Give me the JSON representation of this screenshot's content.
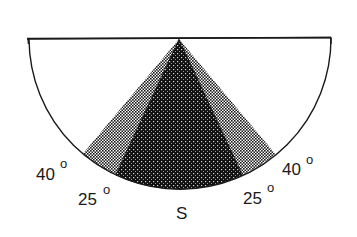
{
  "diagram": {
    "title": "",
    "center": {
      "x": 179,
      "y": 39
    },
    "radius": 150,
    "colors": {
      "outline": "#1a1a1a",
      "background": "#ffffff",
      "inner_wedge": "#111111",
      "outer_band": "#222222"
    },
    "wedges": [
      {
        "name": "outer-band",
        "half_angle_deg": 40,
        "pattern": "checker-light"
      },
      {
        "name": "inner-wedge",
        "half_angle_deg": 25,
        "pattern": "dots-dark"
      }
    ],
    "labels": {
      "left_outer": {
        "value": "40",
        "unit": "o"
      },
      "left_inner": {
        "value": "25",
        "unit": "o"
      },
      "right_outer": {
        "value": "40",
        "unit": "o"
      },
      "right_inner": {
        "value": "25",
        "unit": "o"
      },
      "direction": "S"
    }
  }
}
